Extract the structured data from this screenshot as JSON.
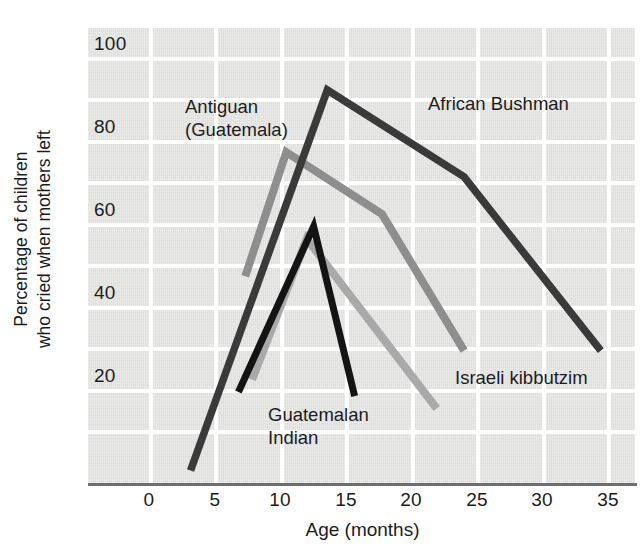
{
  "chart_data": {
    "type": "line",
    "title": "",
    "subtitle": "",
    "xlabel": "Age (months)",
    "ylabel": "Percentage of children\nwho cried when mothers left",
    "ylabel_line1": "Percentage of children",
    "ylabel_line2": "who cried when mothers left",
    "xlim": [
      -2.5,
      37.5
    ],
    "ylim": [
      0,
      110
    ],
    "xticks": [
      0,
      5,
      10,
      15,
      20,
      25,
      30,
      35
    ],
    "xtick_labels": [
      "0",
      "5",
      "10",
      "15",
      "20",
      "25",
      "30",
      "35"
    ],
    "yticks": [
      20,
      40,
      60,
      80,
      100
    ],
    "ytick_labels": [
      "20",
      "40",
      "60",
      "80",
      "100"
    ],
    "grid": true,
    "grid_color": "#ffffff",
    "plot_background": "#dededd",
    "legend_position": "inline-annotations",
    "series": [
      {
        "name": "African Bushman",
        "color": "#3a3a3a",
        "label_text": "African Bushman",
        "x": [
          5,
          15,
          25,
          35
        ],
        "y": [
          3,
          95,
          74,
          32
        ]
      },
      {
        "name": "Antiguan (Guatemala)",
        "color": "#8e8e8e",
        "label_text": "Antiguan\n(Guatemala)",
        "x": [
          9,
          12,
          19,
          25
        ],
        "y": [
          50,
          80,
          65,
          32
        ]
      },
      {
        "name": "Israeli kibbutzim",
        "color": "#a9a9a9",
        "label_text": "Israeli kibbutzim",
        "x": [
          9.5,
          13.5,
          23
        ],
        "y": [
          25,
          59,
          18
        ]
      },
      {
        "name": "Guatemalan Indian",
        "color": "#141414",
        "label_text": "Guatemalan\nIndian",
        "x": [
          8.5,
          14,
          17
        ],
        "y": [
          22,
          62,
          21
        ]
      }
    ],
    "annotations": [
      {
        "name": "antiguan-label",
        "text": "Antiguan\n(Guatemala)",
        "x_px": 185,
        "y_px": 95
      },
      {
        "name": "african-bushman-label",
        "text": "African Bushman",
        "x_px": 428,
        "y_px": 92
      },
      {
        "name": "israeli-kibbutzim-label",
        "text": "Israeli kibbutzim",
        "x_px": 455,
        "y_px": 366
      },
      {
        "name": "guatemalan-indian-label",
        "text": "Guatemalan\nIndian",
        "x_px": 268,
        "y_px": 403
      }
    ]
  }
}
